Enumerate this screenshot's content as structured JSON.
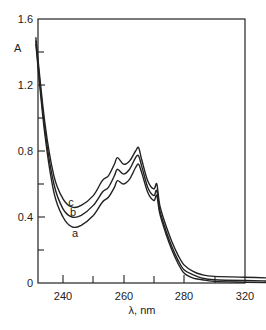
{
  "chart_data": {
    "type": "line",
    "title": "",
    "xlabel": "λ, nm",
    "ylabel": "A",
    "xlim": [
      231,
      320
    ],
    "ylim": [
      0,
      1.6
    ],
    "x_ticks": [
      240,
      260,
      280,
      320
    ],
    "x_minor_ticks": [
      250,
      270,
      300
    ],
    "y_ticks": [
      0,
      0.4,
      0.8,
      1.2,
      1.6
    ],
    "y_minor_ticks": [
      0.2,
      0.6,
      1.0,
      1.4
    ],
    "grid": false,
    "legend": "inline curve labels a, b, c",
    "series": [
      {
        "name": "a",
        "x": [
          231,
          234,
          237,
          240,
          243,
          246,
          250,
          253,
          255,
          257,
          258,
          260,
          262,
          264,
          265,
          266,
          268,
          270,
          271,
          272,
          274,
          276,
          278,
          280,
          283,
          286,
          290,
          300,
          318
        ],
        "y": [
          1.45,
          0.9,
          0.55,
          0.4,
          0.34,
          0.35,
          0.41,
          0.49,
          0.52,
          0.58,
          0.62,
          0.6,
          0.63,
          0.7,
          0.72,
          0.67,
          0.55,
          0.5,
          0.53,
          0.42,
          0.3,
          0.2,
          0.12,
          0.06,
          0.03,
          0.02,
          0.01,
          0.005,
          0.0
        ]
      },
      {
        "name": "b",
        "x": [
          231,
          234,
          237,
          240,
          243,
          246,
          250,
          253,
          255,
          257,
          258,
          260,
          262,
          264,
          265,
          266,
          268,
          270,
          271,
          272,
          274,
          276,
          278,
          280,
          283,
          286,
          290,
          300,
          314
        ],
        "y": [
          1.47,
          0.93,
          0.6,
          0.45,
          0.4,
          0.41,
          0.47,
          0.55,
          0.58,
          0.65,
          0.69,
          0.66,
          0.69,
          0.76,
          0.77,
          0.71,
          0.58,
          0.53,
          0.56,
          0.44,
          0.32,
          0.22,
          0.14,
          0.08,
          0.05,
          0.03,
          0.02,
          0.015,
          0.01
        ]
      },
      {
        "name": "c",
        "x": [
          231,
          234,
          237,
          240,
          243,
          246,
          250,
          253,
          255,
          257,
          258,
          260,
          262,
          264,
          265,
          266,
          268,
          270,
          271,
          272,
          274,
          276,
          278,
          280,
          283,
          286,
          290,
          300,
          310
        ],
        "y": [
          1.49,
          0.97,
          0.65,
          0.51,
          0.46,
          0.47,
          0.53,
          0.62,
          0.65,
          0.72,
          0.76,
          0.72,
          0.74,
          0.8,
          0.82,
          0.75,
          0.62,
          0.57,
          0.6,
          0.47,
          0.35,
          0.25,
          0.17,
          0.11,
          0.07,
          0.05,
          0.04,
          0.035,
          0.03
        ]
      }
    ]
  },
  "labels": {
    "y_axis": "A",
    "x_axis": "λ, nm",
    "curve_a": "a",
    "curve_b": "b",
    "curve_c": "c",
    "y_tick_0": "0",
    "y_tick_04": "0.4",
    "y_tick_08": "0.8",
    "y_tick_12": "1.2",
    "y_tick_16": "1.6",
    "x_tick_240": "240",
    "x_tick_260": "260",
    "x_tick_280": "280",
    "x_tick_320": "320"
  }
}
